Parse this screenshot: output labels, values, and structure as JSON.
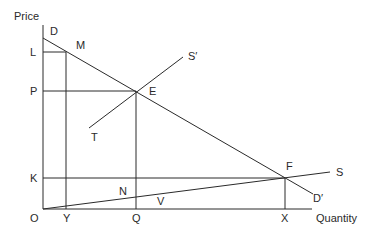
{
  "diagram": {
    "axes": {
      "y_label": "Price",
      "x_label": "Quantity",
      "origin_label": "O"
    },
    "price_labels": [
      "L",
      "P",
      "K"
    ],
    "quantity_labels": [
      "Y",
      "Q",
      "X"
    ],
    "curves": {
      "demand": {
        "start_label": "D",
        "end_label": "D′"
      },
      "supply_steep": {
        "start_label": "T",
        "end_label": "S′"
      },
      "supply_flat": {
        "end_label": "S"
      }
    },
    "points": {
      "M": "M",
      "E": "E",
      "F": "F",
      "N": "N",
      "V": "V"
    }
  }
}
